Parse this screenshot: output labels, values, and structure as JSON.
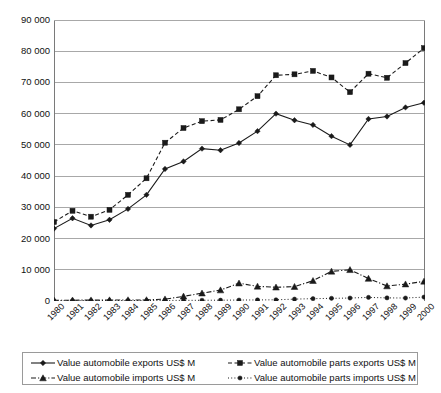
{
  "chart_data": {
    "type": "line",
    "title": "",
    "xlabel": "",
    "ylabel": "",
    "ylim": [
      0,
      90000
    ],
    "ytick_labels": [
      "90 000",
      "80 000",
      "70 000",
      "60 000",
      "50 000",
      "40 000",
      "30 000",
      "20 000",
      "10 000",
      "0"
    ],
    "ytick_values": [
      90000,
      80000,
      70000,
      60000,
      50000,
      40000,
      30000,
      20000,
      10000,
      0
    ],
    "grid": true,
    "legend_position": "bottom",
    "categories": [
      "1980",
      "1981",
      "1982",
      "1983",
      "1984",
      "1985",
      "1986",
      "1987",
      "1988",
      "1989",
      "1990",
      "1991",
      "1992",
      "1993",
      "1994",
      "1995",
      "1996",
      "1997",
      "1998",
      "1999",
      "2000"
    ],
    "series": [
      {
        "name": "Value automobile exports US$ M",
        "marker": "diamond",
        "line_style": "solid",
        "color": "#1a1a1a",
        "values": [
          23200,
          26500,
          24200,
          26000,
          29500,
          34000,
          42300,
          44700,
          48800,
          48300,
          50600,
          54400,
          60000,
          57900,
          56400,
          52800,
          50000,
          58300,
          59100,
          62000,
          63500
        ]
      },
      {
        "name": "Value automobile parts exports US$ M",
        "marker": "square",
        "line_style": "dashed",
        "color": "#1a1a1a",
        "values": [
          25300,
          28900,
          27000,
          29200,
          34000,
          39300,
          50700,
          55400,
          57600,
          58000,
          61400,
          65600,
          72300,
          72600,
          73700,
          71600,
          66900,
          72800,
          71500,
          76200,
          81000
        ]
      },
      {
        "name": "Value automobile imports US$ M",
        "marker": "triangle",
        "line_style": "dashdot",
        "color": "#1a1a1a",
        "values": [
          250,
          260,
          280,
          300,
          320,
          350,
          600,
          1500,
          2500,
          3500,
          5700,
          4700,
          4400,
          4600,
          6500,
          9500,
          10000,
          7200,
          4800,
          5400,
          6300
        ]
      },
      {
        "name": "Value automobile parts imports US$ M",
        "marker": "circle",
        "line_style": "dotted",
        "color": "#1a1a1a",
        "values": [
          120,
          120,
          130,
          140,
          150,
          160,
          180,
          200,
          230,
          260,
          300,
          340,
          380,
          600,
          750,
          850,
          950,
          1150,
          1000,
          950,
          1250
        ]
      }
    ]
  },
  "legend": {
    "rows": [
      {
        "left": {
          "label": "Value automobile exports US$ M",
          "marker": "diamond",
          "line_style": "solid"
        },
        "right": {
          "label": "Value automobile parts exports US$ M",
          "marker": "square",
          "line_style": "dashed"
        }
      },
      {
        "left": {
          "label": "Value automobile imports US$ M",
          "marker": "triangle",
          "line_style": "dashdot"
        },
        "right": {
          "label": "Value automobile parts imports US$ M",
          "marker": "circle",
          "line_style": "dotted"
        }
      }
    ]
  },
  "style": {
    "axis_color": "#7a7a7a",
    "grid_color": "#a8a8a8",
    "series_color": "#1a1a1a",
    "background": "#ffffff"
  }
}
